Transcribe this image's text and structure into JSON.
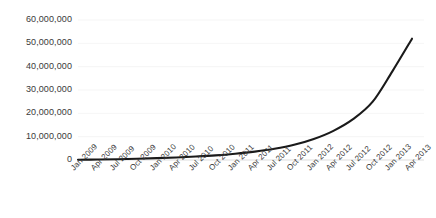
{
  "chart_data": {
    "type": "line",
    "title": "",
    "subtitle": "",
    "xlabel": "",
    "ylabel": "",
    "grid": true,
    "legend": false,
    "legend_position": "none",
    "line_color": "#1a1a1a",
    "background_color": "#ffffff",
    "gridline_color": "#f2f2f2",
    "tick_label_color": "#3a3a3a",
    "ylim": [
      0,
      60000000
    ],
    "ytick_values": [
      0,
      10000000,
      20000000,
      30000000,
      40000000,
      50000000,
      60000000
    ],
    "ytick_labels": [
      "0",
      "10,000,000",
      "20,000,000",
      "30,000,000",
      "40,000,000",
      "50,000,000",
      "60,000,000"
    ],
    "categories": [
      "Jan 2009",
      "Apr 2009",
      "Jul 2009",
      "Oct 2009",
      "Jan 2010",
      "Apr 2010",
      "Jul 2010",
      "Oct 2010",
      "Jan 2011",
      "Apr 2011",
      "Jul 2011",
      "Oct 2011",
      "Jan 2012",
      "Apr 2012",
      "Jul 2012",
      "Oct 2012",
      "Jan 2013",
      "Apr 2013"
    ],
    "values": [
      100000,
      200000,
      350000,
      550000,
      800000,
      1100000,
      1500000,
      2000000,
      2700000,
      3600000,
      4800000,
      6500000,
      9000000,
      12500000,
      17500000,
      25000000,
      38000000,
      52000000
    ]
  }
}
